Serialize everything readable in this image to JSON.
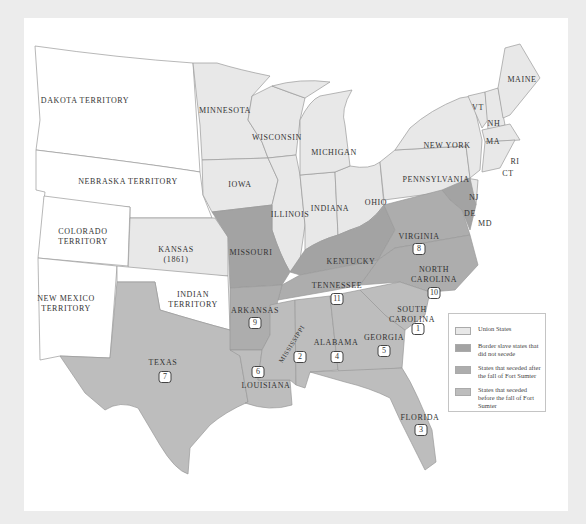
{
  "colors": {
    "page_bg": "#ececec",
    "panel_bg": "#ffffff",
    "territory": "#ffffff",
    "union": "#e8e8e8",
    "border_slave": "#a3a3a3",
    "seceded_after": "#adadad",
    "seceded_before": "#bdbdbd",
    "outline": "#9a9a9a"
  },
  "labels": {
    "dakota": "DAKOTA TERRITORY",
    "nebraska": "NEBRASKA TERRITORY",
    "colorado": [
      "COLORADO",
      "TERRITORY"
    ],
    "kansas": [
      "KANSAS",
      "(1861)"
    ],
    "new_mexico": [
      "NEW MEXICO",
      "TERRITORY"
    ],
    "indian": [
      "INDIAN",
      "TERRITORY"
    ],
    "minnesota": "MINNESOTA",
    "wisconsin": "WISCONSIN",
    "iowa": "IOWA",
    "michigan": "MICHIGAN",
    "illinois": "ILLINOIS",
    "indiana": "INDIANA",
    "ohio": "OHIO",
    "pennsylvania": "PENNSYLVANIA",
    "new_york": "NEW YORK",
    "maine": "MAINE",
    "vt": "VT",
    "nh": "NH",
    "ma": "MA",
    "ri": "RI",
    "ct": "CT",
    "nj": "NJ",
    "de": "DE",
    "md": "MD",
    "missouri": "MISSOURI",
    "kentucky": "KENTUCKY",
    "virginia": "VIRGINIA",
    "north_carolina": [
      "NORTH",
      "CAROLINA"
    ],
    "tennessee": "TENNESSEE",
    "arkansas": "ARKANSAS",
    "south_carolina": [
      "SOUTH",
      "CAROLINA"
    ],
    "mississippi": "MISSISSIPPI",
    "alabama": "ALABAMA",
    "georgia": "GEORGIA",
    "texas": "TEXAS",
    "louisiana": "LOUISIANA",
    "florida": "FLORIDA"
  },
  "secession_order": {
    "south_carolina": "1",
    "mississippi": "2",
    "florida": "3",
    "alabama": "4",
    "georgia": "5",
    "louisiana": "6",
    "texas": "7",
    "virginia": "8",
    "arkansas": "9",
    "north_carolina": "10",
    "tennessee": "11"
  },
  "legend": {
    "items": [
      {
        "label": "Union States",
        "color": "#e8e8e8"
      },
      {
        "label": "Border slave states that did not secede",
        "color": "#a3a3a3"
      },
      {
        "label": "States that seceded after the fall of Fort Sumter",
        "color": "#adadad"
      },
      {
        "label": "States that seceded before the fall of Fort Sumter",
        "color": "#bdbdbd"
      }
    ]
  }
}
